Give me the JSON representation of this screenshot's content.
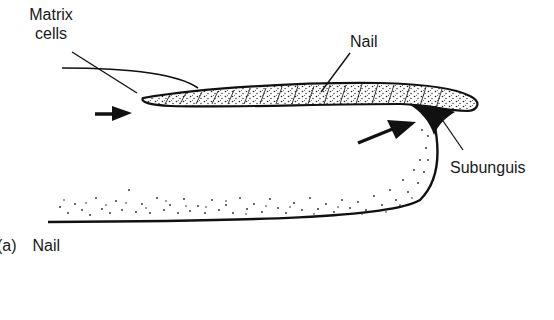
{
  "figure": {
    "caption_prefix": "(a)",
    "caption_title": "Nail",
    "labels": {
      "matrix_line1": "Matrix",
      "matrix_line2": "cells",
      "nail": "Nail",
      "subunguis": "Subunguis"
    },
    "arrows": [
      {
        "name": "matrix-arrow",
        "direction": "right",
        "points_to": "nail root / matrix"
      },
      {
        "name": "subunguis-arrow",
        "direction": "up-right",
        "points_to": "subunguis"
      }
    ],
    "colors": {
      "ink": "#111111",
      "background": "#ffffff"
    }
  }
}
